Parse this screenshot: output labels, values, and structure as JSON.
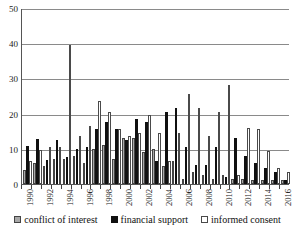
{
  "chart_data": {
    "type": "bar",
    "title": "",
    "subtitle": "",
    "xlabel": "",
    "ylabel": "",
    "ylim": [
      0,
      50
    ],
    "yticks": [
      0,
      10,
      20,
      30,
      40,
      50
    ],
    "grid": true,
    "legend_position": "bottom",
    "categories": [
      "1990",
      "1991",
      "1992",
      "1993",
      "1994",
      "1995",
      "1996",
      "1997",
      "1998",
      "1999",
      "2000",
      "2001",
      "2002",
      "2003",
      "2004",
      "2005",
      "2006",
      "2007",
      "2008",
      "2009",
      "2010",
      "2011",
      "2012",
      "2013",
      "2014",
      "2015",
      "2016"
    ],
    "tick_labels": [
      "1990",
      "",
      "1992",
      "",
      "1994",
      "",
      "1996",
      "",
      "1998",
      "",
      "2000",
      "",
      "2002",
      "",
      "2004",
      "",
      "2006",
      "",
      "2008",
      "",
      "2010",
      "",
      "2012",
      "",
      "2014",
      "",
      "2016"
    ],
    "series": [
      {
        "name": "conflict of interest",
        "color": "#a8a8a8",
        "values": [
          4,
          6,
          5,
          7,
          7,
          8,
          6,
          10,
          11,
          7,
          13,
          13,
          9,
          10,
          5,
          6.5,
          1.5,
          3.5,
          2.5,
          1.5,
          2.5,
          1.5,
          1.5,
          1,
          1,
          1,
          1
        ]
      },
      {
        "name": "financial support",
        "color": "#101010",
        "values": [
          10.8,
          12.8,
          6.8,
          12.5,
          7.8,
          10,
          10.5,
          15.5,
          17.5,
          15.5,
          12.5,
          18.5,
          17.5,
          6.5,
          20.5,
          21.5,
          10.5,
          5.5,
          5.5,
          10.5,
          2,
          13,
          8,
          6,
          4.5,
          3.5,
          1
        ]
      },
      {
        "name": "informed consent",
        "color": "#ffffff",
        "values": [
          6.5,
          9.8,
          10.5,
          10.5,
          39.5,
          13.5,
          16.5,
          23.5,
          20.5,
          15.5,
          13.5,
          14.5,
          19.5,
          14.5,
          6.5,
          14.5,
          25.5,
          21.5,
          13.5,
          20.5,
          28,
          2.5,
          16,
          15.5,
          9.5,
          4.5,
          3.5
        ]
      }
    ]
  },
  "legend": {
    "items": [
      {
        "label": "conflict of interest",
        "swatch": "coi"
      },
      {
        "label": "financial support",
        "swatch": "fin"
      },
      {
        "label": "informed consent",
        "swatch": "inf"
      }
    ]
  }
}
